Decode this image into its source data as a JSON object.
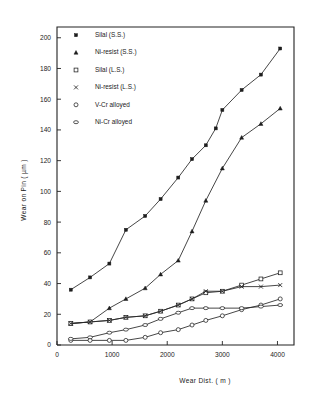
{
  "chart_data": {
    "type": "line",
    "title": "",
    "xlabel": "Wear  Dist. ( m )",
    "ylabel": "Wear on Pin  ( µm )",
    "xlim": [
      0,
      4300
    ],
    "ylim": [
      0,
      207
    ],
    "xticks": [
      0,
      1000,
      2000,
      3000,
      4000
    ],
    "yticks": [
      0,
      20,
      40,
      60,
      80,
      100,
      120,
      140,
      160,
      180,
      200
    ],
    "xticklabels": [
      "0",
      "1000",
      "2000",
      "3000",
      "4000"
    ],
    "yticklabels": [
      "0",
      "20",
      "40",
      "60",
      "80",
      "100",
      "120",
      "140",
      "160",
      "180",
      "200"
    ],
    "grid": false,
    "legend_position": "upper left",
    "series": [
      {
        "name": "Silal (S.S.)",
        "marker": "filled-square",
        "x": [
          250,
          600,
          950,
          1250,
          1600,
          1880,
          2200,
          2450,
          2700,
          2880,
          3000,
          3350,
          3700,
          4050
        ],
        "y": [
          36,
          44,
          53,
          75,
          84,
          95,
          109,
          121,
          130,
          141,
          153,
          166,
          176,
          193
        ]
      },
      {
        "name": "Ni-resist (S.S.)",
        "marker": "filled-triangle",
        "x": [
          250,
          600,
          950,
          1250,
          1600,
          1880,
          2200,
          2450,
          2700,
          3000,
          3350,
          3700,
          4050
        ],
        "y": [
          14,
          15,
          24,
          30,
          37,
          46,
          55,
          74,
          94,
          115,
          135,
          144,
          154
        ]
      },
      {
        "name": "Silal (L.S.)",
        "marker": "open-square",
        "x": [
          250,
          600,
          950,
          1250,
          1600,
          1880,
          2200,
          2450,
          2700,
          3000,
          3350,
          3700,
          4050
        ],
        "y": [
          14,
          15,
          16,
          18,
          19,
          22,
          26,
          30,
          34,
          35,
          39,
          43,
          47
        ]
      },
      {
        "name": "Ni-resist (L.S.)",
        "marker": "cross",
        "x": [
          250,
          600,
          950,
          1250,
          1600,
          1880,
          2200,
          2450,
          2700,
          3000,
          3350,
          3700,
          4050
        ],
        "y": [
          14,
          15,
          16,
          18,
          19,
          22,
          26,
          30,
          35,
          35,
          38,
          38,
          39
        ]
      },
      {
        "name": "V-Cr alloyed",
        "marker": "open-circle",
        "x": [
          250,
          600,
          950,
          1250,
          1600,
          1880,
          2200,
          2450,
          2700,
          3000,
          3350,
          3700,
          4050
        ],
        "y": [
          3,
          3,
          3,
          3,
          5,
          8,
          10,
          13,
          16,
          19,
          23,
          26,
          30
        ]
      },
      {
        "name": "Ni-Cr alloyed",
        "marker": "open-lens",
        "x": [
          250,
          600,
          950,
          1250,
          1600,
          1880,
          2200,
          2450,
          2700,
          3000,
          3350,
          3700,
          4050
        ],
        "y": [
          4,
          5,
          8,
          10,
          13,
          17,
          21,
          24,
          24,
          24,
          24,
          25,
          26
        ]
      }
    ]
  },
  "legend": {
    "items": [
      {
        "label": "Silal (S.S.)",
        "marker": "filled-square"
      },
      {
        "label": "Ni-resist (S.S.)",
        "marker": "filled-triangle"
      },
      {
        "label": "Silal (L.S.)",
        "marker": "open-square"
      },
      {
        "label": "Ni-resist (L.S.)",
        "marker": "cross"
      },
      {
        "label": "V-Cr alloyed",
        "marker": "open-circle"
      },
      {
        "label": "Ni-Cr alloyed",
        "marker": "open-lens"
      }
    ]
  },
  "colors": {
    "ink": "#1d1d1d",
    "background": "#ffffff"
  }
}
